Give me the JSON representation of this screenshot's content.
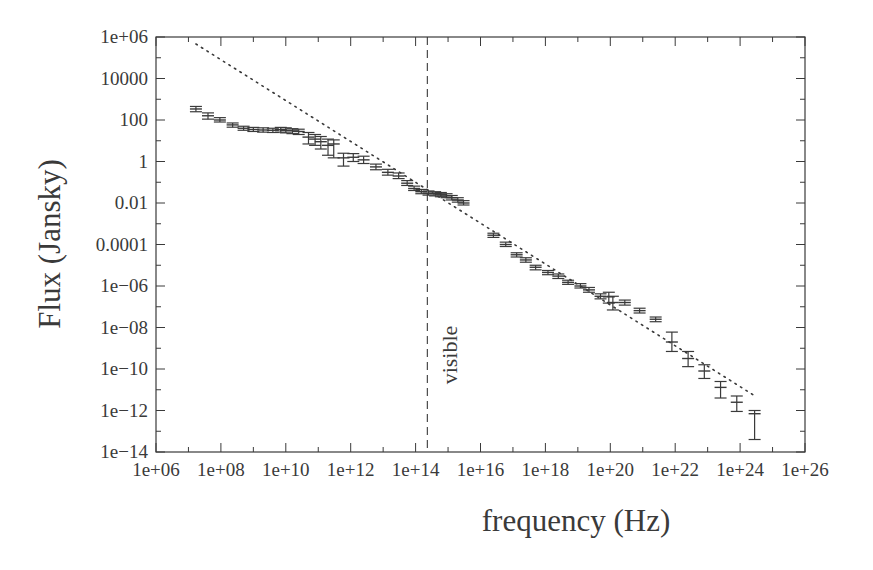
{
  "chart_data": {
    "type": "scatter",
    "title": "",
    "xlabel": "frequency (Hz)",
    "ylabel": "Flux (Jansky)",
    "xscale": "log",
    "yscale": "log",
    "xlim": [
      1000000.0,
      1e+26
    ],
    "ylim": [
      1e-14,
      1000000.0
    ],
    "grid": false,
    "legend": null,
    "x_tick_labels": [
      "1e+06",
      "1e+08",
      "1e+10",
      "1e+12",
      "1e+14",
      "1e+16",
      "1e+18",
      "1e+20",
      "1e+22",
      "1e+24",
      "1e+26"
    ],
    "y_tick_labels": [
      "1e-14",
      "1e-12",
      "1e-10",
      "1e-08",
      "1e-06",
      "0.0001",
      "0.01",
      "1",
      "100",
      "10000",
      "1e+06"
    ],
    "annotations": [
      {
        "type": "vline",
        "style": "dashed",
        "x": 230000000000000.0,
        "label": "visible",
        "label_rotation": -90
      }
    ],
    "series": [
      {
        "name": "measured flux",
        "style": "errorbar",
        "points": [
          {
            "x": 17000000.0,
            "y": 340,
            "ylo": 250,
            "yhi": 450
          },
          {
            "x": 40000000.0,
            "y": 160,
            "ylo": 110,
            "yhi": 220
          },
          {
            "x": 93000000.0,
            "y": 100,
            "ylo": 80,
            "yhi": 130
          },
          {
            "x": 230000000.0,
            "y": 58,
            "ylo": 45,
            "yhi": 72
          },
          {
            "x": 500000000.0,
            "y": 40,
            "ylo": 32,
            "yhi": 50
          },
          {
            "x": 1000000000.0,
            "y": 35,
            "ylo": 28,
            "yhi": 44
          },
          {
            "x": 2000000000.0,
            "y": 33,
            "ylo": 26,
            "yhi": 42
          },
          {
            "x": 4000000000.0,
            "y": 32,
            "ylo": 25,
            "yhi": 40
          },
          {
            "x": 7000000000.0,
            "y": 34,
            "ylo": 26,
            "yhi": 44
          },
          {
            "x": 10000000000.0,
            "y": 32,
            "ylo": 24,
            "yhi": 42
          },
          {
            "x": 16000000000.0,
            "y": 30,
            "ylo": 22,
            "yhi": 38
          },
          {
            "x": 25000000000.0,
            "y": 28,
            "ylo": 20,
            "yhi": 36
          },
          {
            "x": 50000000000.0,
            "y": 15,
            "ylo": 7,
            "yhi": 25
          },
          {
            "x": 80000000000.0,
            "y": 12,
            "ylo": 6,
            "yhi": 20
          },
          {
            "x": 120000000000.0,
            "y": 9,
            "ylo": 4,
            "yhi": 16
          },
          {
            "x": 200000000000.0,
            "y": 6,
            "ylo": 2,
            "yhi": 12
          },
          {
            "x": 300000000000.0,
            "y": 7,
            "ylo": 1.5,
            "yhi": 11
          },
          {
            "x": 600000000000.0,
            "y": 1.5,
            "ylo": 0.6,
            "yhi": 2.5
          },
          {
            "x": 1200000000000.0,
            "y": 1.6,
            "ylo": 1.0,
            "yhi": 2.4
          },
          {
            "x": 2500000000000.0,
            "y": 1.2,
            "ylo": 0.8,
            "yhi": 1.8
          },
          {
            "x": 6000000000000.0,
            "y": 0.55,
            "ylo": 0.4,
            "yhi": 0.75
          },
          {
            "x": 14000000000000.0,
            "y": 0.3,
            "ylo": 0.22,
            "yhi": 0.42
          },
          {
            "x": 30000000000000.0,
            "y": 0.2,
            "ylo": 0.15,
            "yhi": 0.28
          },
          {
            "x": 55000000000000.0,
            "y": 0.09,
            "ylo": 0.07,
            "yhi": 0.12
          },
          {
            "x": 90000000000000.0,
            "y": 0.05,
            "ylo": 0.04,
            "yhi": 0.065
          },
          {
            "x": 150000000000000.0,
            "y": 0.035,
            "ylo": 0.028,
            "yhi": 0.045
          },
          {
            "x": 250000000000000.0,
            "y": 0.03,
            "ylo": 0.024,
            "yhi": 0.038
          },
          {
            "x": 400000000000000.0,
            "y": 0.028,
            "ylo": 0.022,
            "yhi": 0.035
          },
          {
            "x": 600000000000000.0,
            "y": 0.025,
            "ylo": 0.02,
            "yhi": 0.032
          },
          {
            "x": 900000000000000.0,
            "y": 0.022,
            "ylo": 0.018,
            "yhi": 0.028
          },
          {
            "x": 1300000000000000.0,
            "y": 0.018,
            "ylo": 0.014,
            "yhi": 0.023
          },
          {
            "x": 2000000000000000.0,
            "y": 0.014,
            "ylo": 0.011,
            "yhi": 0.018
          },
          {
            "x": 3000000000000000.0,
            "y": 0.01,
            "ylo": 0.008,
            "yhi": 0.013
          },
          {
            "x": 2.5e+16,
            "y": 0.00028,
            "ylo": 0.00022,
            "yhi": 0.00035
          },
          {
            "x": 6e+16,
            "y": 0.0001,
            "ylo": 8e-05,
            "yhi": 0.00013
          },
          {
            "x": 1.3e+17,
            "y": 3.2e-05,
            "ylo": 2.5e-05,
            "yhi": 4e-05
          },
          {
            "x": 2.5e+17,
            "y": 1.8e-05,
            "ylo": 1.4e-05,
            "yhi": 2.3e-05
          },
          {
            "x": 5e+17,
            "y": 8e-06,
            "ylo": 6e-06,
            "yhi": 1e-05
          },
          {
            "x": 1.2e+18,
            "y": 4.5e-06,
            "ylo": 3.5e-06,
            "yhi": 5.6e-06
          },
          {
            "x": 2.5e+18,
            "y": 3e-06,
            "ylo": 2.3e-06,
            "yhi": 3.8e-06
          },
          {
            "x": 5e+18,
            "y": 1.5e-06,
            "ylo": 1.2e-06,
            "yhi": 1.9e-06
          },
          {
            "x": 1.2e+19,
            "y": 1e-06,
            "ylo": 8e-07,
            "yhi": 1.3e-06
          },
          {
            "x": 2.2e+19,
            "y": 6.5e-07,
            "ylo": 5e-07,
            "yhi": 8.5e-07
          },
          {
            "x": 5e+19,
            "y": 3.2e-07,
            "ylo": 2.4e-07,
            "yhi": 4.2e-07
          },
          {
            "x": 9e+19,
            "y": 3e-07,
            "ylo": 1.5e-07,
            "yhi": 5e-07
          },
          {
            "x": 1.2e+20,
            "y": 1.6e-07,
            "ylo": 7e-08,
            "yhi": 3.2e-07
          },
          {
            "x": 2.8e+20,
            "y": 1.6e-07,
            "ylo": 1.2e-07,
            "yhi": 2.1e-07
          },
          {
            "x": 8e+20,
            "y": 6.5e-08,
            "ylo": 5e-08,
            "yhi": 8.5e-08
          },
          {
            "x": 2.5e+21,
            "y": 2.5e-08,
            "ylo": 1.9e-08,
            "yhi": 3.2e-08
          },
          {
            "x": 7.9e+21,
            "y": 2e-09,
            "ylo": 7e-10,
            "yhi": 6e-09
          },
          {
            "x": 2.5e+22,
            "y": 3.2e-10,
            "ylo": 1.3e-10,
            "yhi": 7e-10
          },
          {
            "x": 7.9e+22,
            "y": 8e-11,
            "ylo": 3.5e-11,
            "yhi": 1.6e-10
          },
          {
            "x": 2.5e+23,
            "y": 1.3e-11,
            "ylo": 4e-12,
            "yhi": 2.5e-11
          },
          {
            "x": 7.9e+23,
            "y": 2.5e-12,
            "ylo": 9e-13,
            "yhi": 5e-12
          },
          {
            "x": 2.8e+24,
            "y": 7e-13,
            "ylo": 4e-14,
            "yhi": 1e-12
          }
        ]
      },
      {
        "name": "power-law fit",
        "style": "dotted-line",
        "points": [
          {
            "x": 17000000.0,
            "y": 460000.0
          },
          {
            "x": 3.2e+24,
            "y": 4.5e-12
          }
        ]
      }
    ]
  },
  "labels": {
    "xlabel": "frequency (Hz)",
    "ylabel": "Flux (Jansky)",
    "visible": "visible"
  },
  "colors": {
    "ink": "#3a3a3a",
    "background": "#ffffff"
  }
}
